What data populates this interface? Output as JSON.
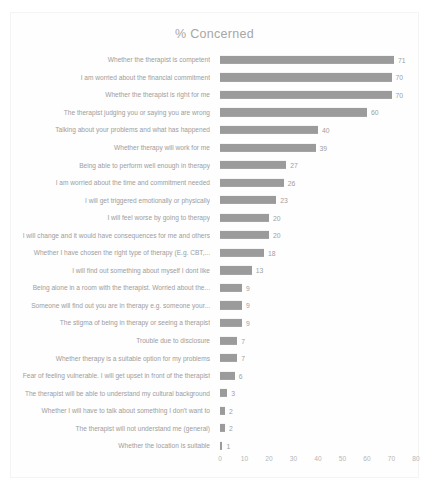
{
  "chart_data": {
    "type": "bar",
    "orientation": "horizontal",
    "title": "% Concerned",
    "xlabel": "",
    "ylabel": "",
    "xlim": [
      0,
      80
    ],
    "xticks": [
      0,
      10,
      20,
      30,
      40,
      50,
      60,
      70,
      80
    ],
    "grid": false,
    "legend": false,
    "bar_color": "#9b9b9b",
    "text_color": "#9d9d9d",
    "background_color": "#ffffff",
    "categories": [
      "Whether the therapist is competent",
      "I am worried about the financial commitment",
      "Whether the therapist is right for me",
      "The therapist judging you or saying you are wrong",
      "Talking about your problems and what has happened",
      "Whether therapy will work for me",
      "Being able to perform well enough in therapy",
      "I am worried about the time and commitment needed",
      "I will get triggered emotionally or physically",
      "I will feel worse by going to therapy",
      "I will change and it would have consequences for me and others",
      "Whether I have chosen the right type of therapy (E.g. CBT,...",
      "I will find out something about myself I dont like",
      "Being alone in a room with the therapist. Worried about the...",
      "Someone will find out you are in therapy e.g. someone your...",
      "The stigma of being in therapy or seeing a therapist",
      "Trouble due to disclosure",
      "Whether therapy is a suitable option for my problems",
      "Fear of feeling vulnerable. I will get upset in front of the therapist",
      "The therapist will be able to understand my cultural background",
      "Whether I will have to talk about something I don't want to",
      "The therapist will not understand me (general)",
      "Whether the location is suitable"
    ],
    "values": [
      71,
      70,
      70,
      60,
      40,
      39,
      27,
      26,
      23,
      20,
      20,
      18,
      13,
      9,
      9,
      9,
      7,
      7,
      6,
      3,
      2,
      2,
      1
    ]
  }
}
